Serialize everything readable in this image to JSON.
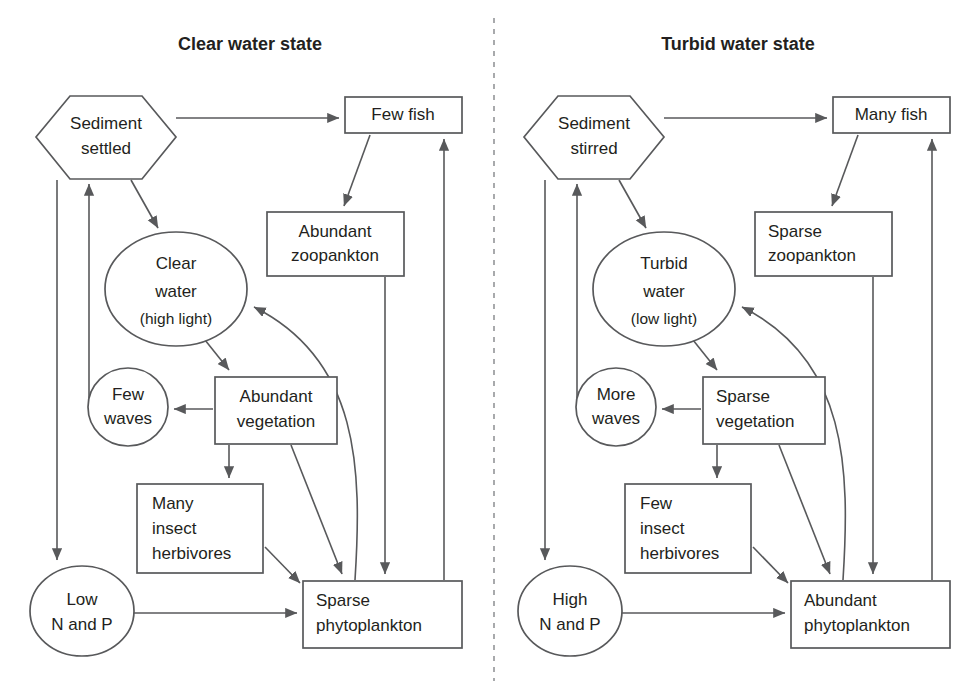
{
  "figure": {
    "width": 978,
    "height": 694,
    "background": "#ffffff",
    "stroke_color": "#58595b",
    "text_color": "#231f20",
    "divider_color": "#939598"
  },
  "panels": [
    {
      "id": "clear",
      "title": "Clear water state",
      "nodes": {
        "sediment": "Sediment\nsettled",
        "sediment_line1": "Sediment",
        "sediment_line2": "settled",
        "fish": "Few fish",
        "water_line1": "Clear",
        "water_line2": "water",
        "water_line3": "(high light)",
        "zooplankton_line1": "Abundant",
        "zooplankton_line2": "zoopankton",
        "waves_line1": "Few",
        "waves_line2": "waves",
        "vegetation_line1": "Abundant",
        "vegetation_line2": "vegetation",
        "insects_line1": "Many",
        "insects_line2": "insect",
        "insects_line3": "herbivores",
        "nutrients_line1": "Low",
        "nutrients_line2": "N and P",
        "phytoplankton_line1": "Sparse",
        "phytoplankton_line2": "phytoplankton"
      }
    },
    {
      "id": "turbid",
      "title": "Turbid water state",
      "nodes": {
        "sediment_line1": "Sediment",
        "sediment_line2": "stirred",
        "fish": "Many fish",
        "water_line1": "Turbid",
        "water_line2": "water",
        "water_line3": "(low light)",
        "zooplankton_line1": "Sparse",
        "zooplankton_line2": "zoopankton",
        "waves_line1": "More",
        "waves_line2": "waves",
        "vegetation_line1": "Sparse",
        "vegetation_line2": "vegetation",
        "insects_line1": "Few",
        "insects_line2": "insect",
        "insects_line3": "herbivores",
        "nutrients_line1": "High",
        "nutrients_line2": "N and P",
        "phytoplankton_line1": "Abundant",
        "phytoplankton_line2": "phytoplankton"
      }
    }
  ],
  "edges": [
    {
      "from": "sediment",
      "to": "fish"
    },
    {
      "from": "sediment",
      "to": "water"
    },
    {
      "from": "sediment",
      "to": "nutrients"
    },
    {
      "from": "fish",
      "to": "zooplankton"
    },
    {
      "from": "zooplankton",
      "to": "phytoplankton"
    },
    {
      "from": "water",
      "to": "vegetation"
    },
    {
      "from": "vegetation",
      "to": "waves"
    },
    {
      "from": "vegetation",
      "to": "insects"
    },
    {
      "from": "vegetation",
      "to": "phytoplankton"
    },
    {
      "from": "waves",
      "to": "sediment"
    },
    {
      "from": "insects",
      "to": "phytoplankton"
    },
    {
      "from": "nutrients",
      "to": "phytoplankton"
    },
    {
      "from": "phytoplankton",
      "to": "water"
    },
    {
      "from": "phytoplankton",
      "to": "fish"
    }
  ]
}
